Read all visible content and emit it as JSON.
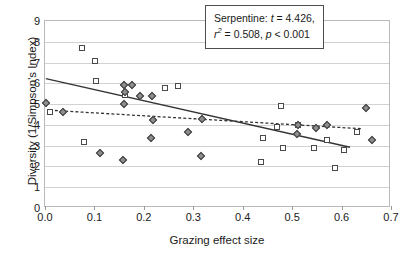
{
  "chart_data": {
    "type": "scatter",
    "title": "",
    "xlabel": "Grazing effect size",
    "ylabel": "Diversity (1/Simpson's Index)",
    "xlim": [
      0.0,
      0.7
    ],
    "ylim": [
      0,
      9
    ],
    "xticks": [
      "0.0",
      "0.1",
      "0.2",
      "0.3",
      "0.4",
      "0.5",
      "0.6",
      "0.7"
    ],
    "yticks": [
      "0",
      "1",
      "2",
      "3",
      "4",
      "5",
      "6",
      "7",
      "8",
      "9"
    ],
    "grid": "horizontal",
    "legend_position": "none",
    "series": [
      {
        "name": "serpentine",
        "marker": "open-square",
        "points": [
          [
            0.01,
            4.63
          ],
          [
            0.075,
            7.7
          ],
          [
            0.078,
            3.19
          ],
          [
            0.101,
            7.08
          ],
          [
            0.104,
            6.09
          ],
          [
            0.162,
            5.43
          ],
          [
            0.243,
            5.78
          ],
          [
            0.27,
            5.86
          ],
          [
            0.438,
            2.2
          ],
          [
            0.441,
            3.36
          ],
          [
            0.47,
            3.9
          ],
          [
            0.477,
            4.92
          ],
          [
            0.481,
            2.9
          ],
          [
            0.512,
            3.99
          ],
          [
            0.545,
            2.9
          ],
          [
            0.57,
            3.28
          ],
          [
            0.587,
            1.92
          ],
          [
            0.604,
            2.77
          ],
          [
            0.631,
            3.68
          ]
        ]
      },
      {
        "name": "non-serpentine",
        "marker": "filled-diamond",
        "points": [
          [
            0.002,
            5.07
          ],
          [
            0.037,
            4.6
          ],
          [
            0.112,
            2.66
          ],
          [
            0.158,
            2.3
          ],
          [
            0.16,
            5.02
          ],
          [
            0.16,
            5.94
          ],
          [
            0.161,
            5.6
          ],
          [
            0.177,
            5.93
          ],
          [
            0.192,
            5.4
          ],
          [
            0.215,
            3.36
          ],
          [
            0.217,
            5.41
          ],
          [
            0.219,
            4.25
          ],
          [
            0.29,
            3.68
          ],
          [
            0.316,
            2.52
          ],
          [
            0.318,
            4.27
          ],
          [
            0.51,
            3.58
          ],
          [
            0.512,
            3.99
          ],
          [
            0.548,
            3.85
          ],
          [
            0.571,
            4.0
          ],
          [
            0.65,
            4.79
          ],
          [
            0.661,
            3.25
          ]
        ]
      }
    ],
    "trendlines": [
      {
        "name": "serpentine-fit",
        "style": "solid",
        "x0": 0.0,
        "y0": 6.2,
        "x1": 0.622,
        "y1": 2.86
      },
      {
        "name": "non-serpentine-fit",
        "style": "dashed",
        "x0": 0.008,
        "y0": 4.66,
        "x1": 0.645,
        "y1": 3.76
      }
    ],
    "annotations": [
      {
        "name": "serpentine-stats",
        "line1_label": "Serpentine:",
        "line1_stat": "t",
        "line1_value": "= 4.426,",
        "line2_stat": "r",
        "line2_sup": "2",
        "line2_value": "= 0.508,",
        "line2_stat2": "p",
        "line2_value2": "< 0.001"
      }
    ]
  }
}
